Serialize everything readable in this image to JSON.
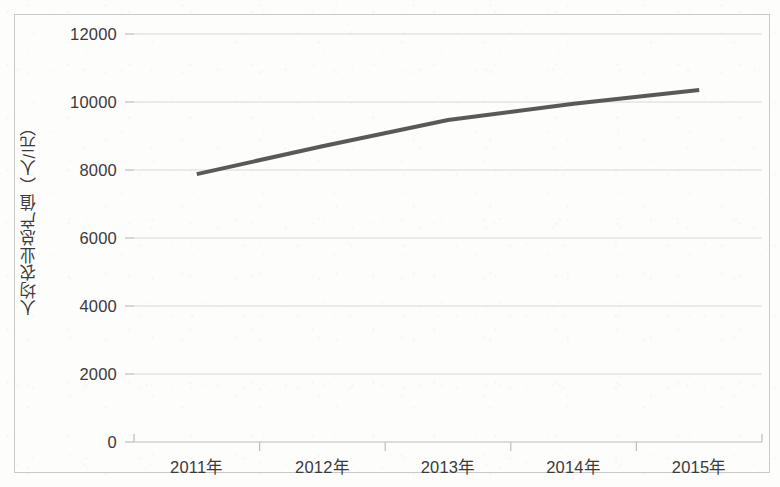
{
  "chart_data": {
    "type": "line",
    "title": "",
    "xlabel": "",
    "ylabel": "人均农业总产值（人/元）",
    "categories": [
      "2011年",
      "2012年",
      "2013年",
      "2014年",
      "2015年"
    ],
    "series": [
      {
        "name": "人均农业总产值",
        "values": [
          7880,
          8700,
          9470,
          9950,
          10350
        ],
        "color": "#595959",
        "line_width": 4,
        "markers": false
      }
    ],
    "ylim": [
      0,
      12000
    ],
    "yticks": [
      0,
      2000,
      4000,
      6000,
      8000,
      10000,
      12000
    ],
    "ytick_labels": [
      "0",
      "2000",
      "4000",
      "6000",
      "8000",
      "10000",
      "12000"
    ],
    "xtick_labels": [
      "2011年",
      "2012年",
      "2013年",
      "2014年",
      "2015年"
    ],
    "grid": {
      "horizontal": true,
      "vertical": false,
      "color": "#d8d8d8"
    },
    "legend": {
      "visible": false,
      "position": "none"
    },
    "axis_color": "#bdbdbd",
    "border_color": "#c9c9c9",
    "background_color": "#ffffff"
  },
  "figure": {
    "frame_visible": true
  }
}
